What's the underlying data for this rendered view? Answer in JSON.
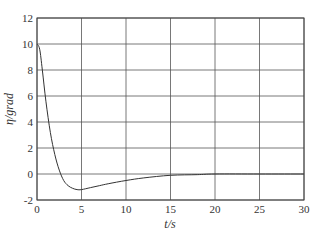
{
  "chart_data": {
    "type": "line",
    "title": "",
    "xlabel": "t/s",
    "ylabel": "η/grad",
    "xlim": [
      0,
      30
    ],
    "ylim": [
      -2,
      12
    ],
    "grid": true,
    "legend": null,
    "x_ticks": [
      "0",
      "5",
      "10",
      "15",
      "20",
      "25",
      "30"
    ],
    "y_ticks": [
      "-2",
      "0",
      "2",
      "4",
      "6",
      "8",
      "10",
      "12"
    ],
    "series": [
      {
        "name": "η",
        "color": "#333333",
        "x": [
          0,
          0.3,
          0.6,
          1.0,
          1.5,
          2.0,
          2.5,
          3.0,
          3.5,
          4.0,
          4.5,
          5.0,
          6.0,
          7.0,
          8.0,
          10.0,
          12.0,
          15.0,
          18.0,
          20.0,
          25.0,
          30.0
        ],
        "y": [
          10.0,
          9.6,
          8.0,
          5.6,
          3.2,
          1.5,
          0.3,
          -0.5,
          -0.9,
          -1.1,
          -1.2,
          -1.2,
          -1.05,
          -0.9,
          -0.75,
          -0.5,
          -0.3,
          -0.1,
          -0.05,
          0.0,
          0.0,
          0.0
        ]
      }
    ]
  }
}
